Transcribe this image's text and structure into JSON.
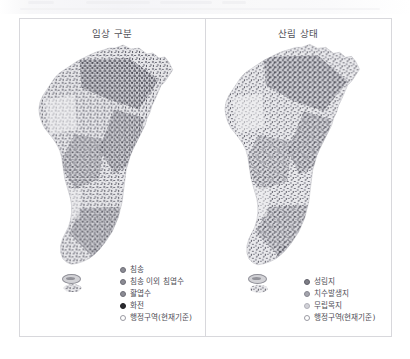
{
  "figure": {
    "panels": [
      {
        "id": "forest-type-panel",
        "title": "임상 구분",
        "legend": [
          {
            "label": "침송",
            "color": "#8c8c94",
            "filled": true
          },
          {
            "label": "침송 이외 침엽수",
            "color": "#8c8c94",
            "filled": true
          },
          {
            "label": "활엽수",
            "color": "#8c8c94",
            "filled": true
          },
          {
            "label": "화전",
            "color": "#2b2b30",
            "filled": true
          },
          {
            "label": "행정구역(현재기준)",
            "color": "#ffffff",
            "filled": false
          }
        ]
      },
      {
        "id": "forest-condition-panel",
        "title": "산림 상태",
        "legend": [
          {
            "label": "성림지",
            "color": "#7e7e86",
            "filled": true
          },
          {
            "label": "치수발생지",
            "color": "#a5a5ad",
            "filled": true
          },
          {
            "label": "무립목지",
            "color": "#d2d2d8",
            "filled": true
          },
          {
            "label": "행정구역(현재기준)",
            "color": "#ffffff",
            "filled": false
          }
        ]
      }
    ],
    "map_subject": "한반도",
    "jeju_island_label": "제주도"
  },
  "colors": {
    "frame_border": "#d8d8dc",
    "title_text": "#53535a",
    "legend_text": "#4e4e55",
    "map_light": "#e8e8ea",
    "map_mid": "#b4b4ba",
    "map_dark": "#6e6e77",
    "map_darkest": "#3a3a42",
    "page_background": "#ffffff"
  }
}
